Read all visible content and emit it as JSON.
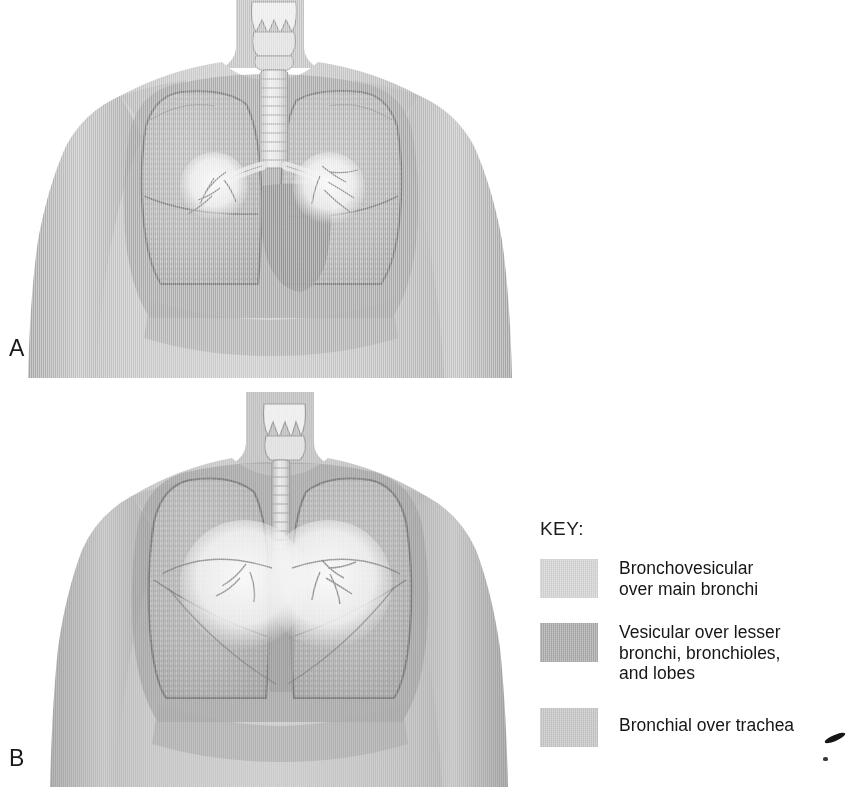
{
  "figure": {
    "type": "medical-illustration",
    "panels": [
      {
        "id": "A",
        "letter": "A",
        "view": "anterior-chest",
        "description": "Anterior view of male torso with lungs, larynx, trachea, and main bronchi overlaid; bronchovesicular circles over main bronchi"
      },
      {
        "id": "B",
        "letter": "B",
        "view": "posterior-chest",
        "description": "Posterior view of male torso with lungs and trachea overlaid; two overlapping bronchovesicular circles over main bronchi"
      }
    ]
  },
  "legend": {
    "title": "KEY:",
    "items": [
      {
        "label": "Bronchovesicular\nover main bronchi",
        "color": "#d2d2d2",
        "region": "main-bronchi"
      },
      {
        "label": "Vesicular over lesser\nbronchi, bronchioles,\nand lobes",
        "color": "#a8a8a8",
        "region": "lesser-bronchi-bronchioles-lobes"
      },
      {
        "label": "Bronchial over trachea",
        "color": "#c4c4c4",
        "region": "trachea"
      }
    ]
  },
  "palette": {
    "background": "#ffffff",
    "skin_light": "#c9c9c9",
    "skin_mid": "#b4b4b4",
    "skin_shadow": "#9c9c9c",
    "ribcage_band": "#a0a0a0",
    "lung_fill": "#b0b0b0",
    "lung_outline": "#7d7d7d",
    "mediastinum": "#9a9a9a",
    "airway_light": "#e6e6e6",
    "bronchi_highlight": "#f2f2f2",
    "text": "#161616"
  }
}
